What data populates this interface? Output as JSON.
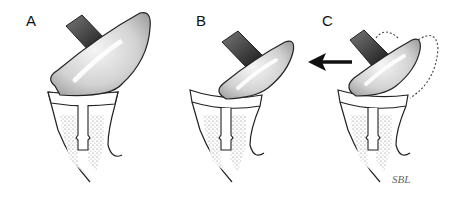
{
  "figure": {
    "type": "medical-illustration",
    "panels": [
      {
        "id": "A",
        "label": "A",
        "description": "large glenosphere seated on humeral component"
      },
      {
        "id": "B",
        "label": "B",
        "description": "smaller glenosphere, medialized position"
      },
      {
        "id": "C",
        "label": "C",
        "description": "glenosphere displaced with dotted outline of prior position and arrow"
      }
    ],
    "annotations": {
      "arrow_direction": "left",
      "signature": "SBL"
    },
    "colors": {
      "outline": "#222222",
      "glenosphere_fill": "#d8d8d8",
      "baseplate_dark": "#333333",
      "stipple": "#888888",
      "background": "#ffffff"
    }
  }
}
